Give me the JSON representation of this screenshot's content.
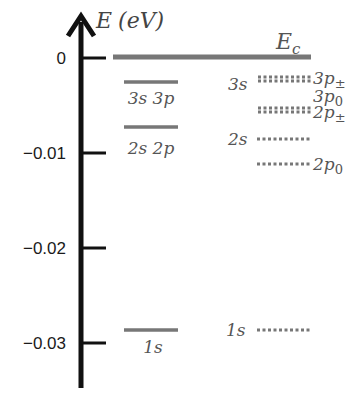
{
  "axis": {
    "title_symbol": "E",
    "title_unit": "(eV)",
    "ticks": [
      {
        "label": "0",
        "value": 0,
        "y": 58
      },
      {
        "label": "−0.01",
        "value": -0.01,
        "y": 153
      },
      {
        "label": "−0.02",
        "value": -0.02,
        "y": 248
      },
      {
        "label": "−0.03",
        "value": -0.03,
        "y": 343
      }
    ]
  },
  "conduction_band": {
    "label": "E",
    "subscript": "c"
  },
  "left_levels": [
    {
      "label": "3s 3p",
      "y": 82
    },
    {
      "label": "2s 2p",
      "y": 127
    },
    {
      "label": "1s",
      "y": 330
    }
  ],
  "right_levels": {
    "s_labels": [
      {
        "label": "3s",
        "y": 88
      },
      {
        "label": "2s",
        "y": 143
      },
      {
        "label": "1s",
        "y": 334
      }
    ],
    "p_labels": [
      {
        "main": "3p",
        "sub": "±",
        "y": 84
      },
      {
        "main": "3p",
        "sub": "0",
        "y": 102
      },
      {
        "main": "2p",
        "sub": "±",
        "y": 118
      },
      {
        "main": "2p",
        "sub": "0",
        "y": 170
      }
    ]
  },
  "colors": {
    "axis": "#111111",
    "level": "#777777",
    "dotted": "#777777",
    "text": "#555555"
  }
}
